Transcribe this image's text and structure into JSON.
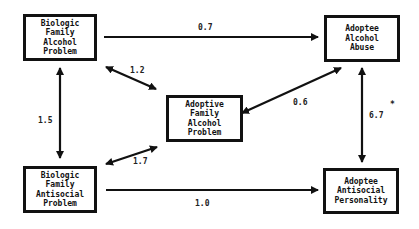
{
  "diagram": {
    "type": "path-diagram",
    "nodes": {
      "bio_alcohol": {
        "lines": [
          "Biologic",
          "Family",
          "Alcohol",
          "Problem"
        ]
      },
      "adoptee_alcohol": {
        "lines": [
          "Adoptee",
          "Alcohol",
          "Abuse"
        ]
      },
      "adoptive_alcohol": {
        "lines": [
          "Adoptive",
          "Family",
          "Alcohol",
          "Problem"
        ]
      },
      "bio_antisocial": {
        "lines": [
          "Biologic",
          "Family",
          "Antisocial",
          "Problem"
        ]
      },
      "adoptee_antisocial": {
        "lines": [
          "Adoptee",
          "Antisocial",
          "Personality"
        ]
      }
    },
    "edges": {
      "bio_alcohol_to_adoptee_alcohol": {
        "label": "0.7",
        "direction": "one-way"
      },
      "bio_alcohol_adoptive_alcohol": {
        "label": "1.2",
        "direction": "two-way"
      },
      "bio_alcohol_bio_antisocial": {
        "label": "1.5",
        "direction": "two-way"
      },
      "adoptee_alcohol_adoptive_alcohol": {
        "label": "0.6",
        "direction": "two-way"
      },
      "adoptee_alcohol_adoptee_antisocial": {
        "label": "6.7",
        "marker": "*",
        "direction": "two-way"
      },
      "bio_antisocial_adoptive_alcohol": {
        "label": "1.7",
        "direction": "two-way"
      },
      "bio_antisocial_to_adoptee_antisocial": {
        "label": "1.0",
        "direction": "one-way"
      }
    },
    "colors": {
      "line": "#111111",
      "background": "#ffffff"
    }
  }
}
